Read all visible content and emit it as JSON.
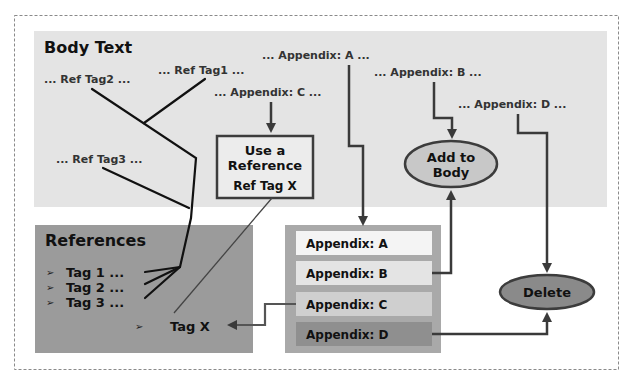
{
  "diagram": {
    "colors": {
      "background": "#ffffff",
      "outer_border": "#8a8a8a",
      "body_panel": "#e4e4e4",
      "references_panel": "#9b9b9b",
      "appendix_container": "#a9a9a9",
      "appendix_a_row": "#f4f4f4",
      "appendix_b_row": "#e4e4e4",
      "appendix_c_row": "#cfcfcf",
      "appendix_d_row": "#8f8f8f",
      "add_to_body_fill": "#c8c8c8",
      "delete_fill": "#8a8a8a",
      "arrow": "#3a3a3a",
      "tag_line": "#111111",
      "use_ref_box_border": "#3c3c3c",
      "use_ref_box_fill": "#ececec"
    },
    "body_text": {
      "title": "Body Text",
      "snippets": {
        "ref_tag1": "... Ref Tag1 ...",
        "ref_tag2": "... Ref Tag2 ...",
        "ref_tag3": "... Ref Tag3 ...",
        "appendix_a": "... Appendix: A ...",
        "appendix_b": "... Appendix: B  ...",
        "appendix_c": "... Appendix: C ...",
        "appendix_d": "... Appendix: D  ..."
      }
    },
    "use_reference_box": {
      "line1": "Use a",
      "line2": "Reference",
      "line3": "Ref Tag X"
    },
    "add_to_body": {
      "line1": "Add to",
      "line2": "Body"
    },
    "delete_node": {
      "label": "Delete"
    },
    "references": {
      "title": "References",
      "bullet_glyph": "➢",
      "items": [
        {
          "label": "Tag 1 ..."
        },
        {
          "label": "Tag 2 ..."
        },
        {
          "label": "Tag 3 ..."
        }
      ],
      "tag_x": "Tag X"
    },
    "appendix_list": {
      "rows": [
        {
          "label": "Appendix: A"
        },
        {
          "label": "Appendix: B"
        },
        {
          "label": "Appendix: C"
        },
        {
          "label": "Appendix: D"
        }
      ]
    }
  }
}
